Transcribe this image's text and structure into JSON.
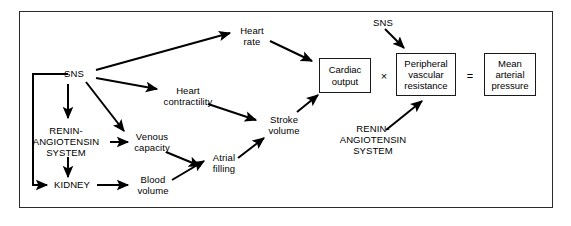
{
  "figure": {
    "frame": {
      "x": 19,
      "y": 11,
      "width": 534,
      "height": 197
    },
    "canvas": {
      "width": 571,
      "height": 226
    },
    "colors": {
      "background": "#ffffff",
      "stroke": "#000000",
      "frame_border": "#2b2b2b",
      "box_border": "#1a1a1a",
      "text": "#000000"
    }
  },
  "nodes": {
    "sns_left": {
      "label": "SNS",
      "cx": 74,
      "cy": 74
    },
    "renin_left": {
      "label": "RENIN-\nANGIOTENSIN\nSYSTEM",
      "cx": 66,
      "cy": 142
    },
    "kidney": {
      "label": "KIDNEY",
      "cx": 72,
      "cy": 185
    },
    "heart_rate": {
      "label": "Heart\nrate",
      "cx": 252,
      "cy": 36
    },
    "heart_contractility": {
      "label": "Heart\ncontractility",
      "cx": 188,
      "cy": 96
    },
    "venous_capacity": {
      "label": "Venous\ncapacity",
      "cx": 152,
      "cy": 142
    },
    "blood_volume": {
      "label": "Blood\nvolume",
      "cx": 153,
      "cy": 185
    },
    "atrial_filling": {
      "label": "Atrial\nfilling",
      "cx": 224,
      "cy": 163
    },
    "stroke_volume": {
      "label": "Stroke\nvolume",
      "cx": 284,
      "cy": 125
    },
    "sns_right": {
      "label": "SNS",
      "cx": 383,
      "cy": 23
    },
    "renin_right": {
      "label": "RENIN-\nANGIOTENSIN\nSYSTEM",
      "cx": 373,
      "cy": 140
    }
  },
  "boxes": {
    "cardiac_output": {
      "label": "Cardiac\noutput",
      "x": 319,
      "y": 58,
      "width": 52,
      "height": 35
    },
    "peripheral_vascular_resistance": {
      "label": "Peripheral\nvascular\nresistance",
      "x": 396,
      "y": 53,
      "width": 60,
      "height": 43
    },
    "mean_arterial_pressure": {
      "label": "Mean\narterial\npressure",
      "x": 484,
      "y": 53,
      "width": 52,
      "height": 43
    }
  },
  "operators": {
    "multiply": {
      "symbol": "×",
      "cx": 384,
      "cy": 76
    },
    "equals": {
      "symbol": "=",
      "cx": 470,
      "cy": 76
    }
  },
  "edges": [
    {
      "from": "sns_left",
      "to": "heart_rate",
      "type": "arrow"
    },
    {
      "from": "sns_left",
      "to": "heart_contractility",
      "type": "arrow"
    },
    {
      "from": "sns_left",
      "to": "venous_capacity",
      "type": "arrow"
    },
    {
      "from": "sns_left",
      "to": "renin_left",
      "type": "arrow"
    },
    {
      "from": "sns_left",
      "to": "kidney",
      "type": "elbow-arrow"
    },
    {
      "from": "renin_left",
      "to": "venous_capacity",
      "type": "arrow"
    },
    {
      "from": "renin_left",
      "to": "kidney",
      "type": "arrow"
    },
    {
      "from": "kidney",
      "to": "blood_volume",
      "type": "arrow"
    },
    {
      "from": "venous_capacity",
      "to": "atrial_filling",
      "type": "arrow"
    },
    {
      "from": "blood_volume",
      "to": "atrial_filling",
      "type": "arrow"
    },
    {
      "from": "atrial_filling",
      "to": "stroke_volume",
      "type": "arrow"
    },
    {
      "from": "heart_contractility",
      "to": "stroke_volume",
      "type": "arrow"
    },
    {
      "from": "heart_rate",
      "to": "cardiac_output",
      "type": "arrow"
    },
    {
      "from": "stroke_volume",
      "to": "cardiac_output",
      "type": "arrow"
    },
    {
      "from": "sns_right",
      "to": "peripheral_vascular_resistance",
      "type": "arrow"
    },
    {
      "from": "renin_right",
      "to": "peripheral_vascular_resistance",
      "type": "arrow"
    }
  ],
  "geometry": {
    "paths": [
      {
        "name": "sns-to-heart-rate",
        "d": "M 96 70 L 230 33",
        "arrow": true
      },
      {
        "name": "sns-to-heart-contractility",
        "d": "M 96 78 L 157 89",
        "arrow": true
      },
      {
        "name": "sns-to-venous-capacity",
        "d": "M 86 82 L 124 131",
        "arrow": true
      },
      {
        "name": "sns-to-renin",
        "d": "M 68 84 L 68 118",
        "arrow": true
      },
      {
        "name": "sns-elbow-to-kidney",
        "d": "M 68 74 L 33 74 L 33 185 L 47 185",
        "arrow": true
      },
      {
        "name": "renin-to-venous-capacity",
        "d": "M 110 142 L 128 142",
        "arrow": true
      },
      {
        "name": "renin-to-kidney",
        "d": "M 68 157 L 68 177",
        "arrow": true
      },
      {
        "name": "kidney-to-blood-volume",
        "d": "M 97 185 L 128 185",
        "arrow": true
      },
      {
        "name": "venous-capacity-to-atrial-filling",
        "d": "M 166 152 L 200 166",
        "arrow": true
      },
      {
        "name": "blood-volume-to-atrial-filling",
        "d": "M 172 180 L 204 161",
        "arrow": true
      },
      {
        "name": "atrial-filling-to-stroke-volume",
        "d": "M 238 158 L 264 138",
        "arrow": true
      },
      {
        "name": "heart-contractility-to-stroke-volume",
        "d": "M 208 104 L 256 120",
        "arrow": true
      },
      {
        "name": "heart-rate-to-cardiac-output",
        "d": "M 270 41 L 312 61",
        "arrow": true
      },
      {
        "name": "stroke-volume-to-cardiac-output",
        "d": "M 297 112 L 318 95",
        "arrow": true
      },
      {
        "name": "sns-right-to-pvr",
        "d": "M 385 29 L 404 48",
        "arrow": true
      },
      {
        "name": "renin-right-to-pvr",
        "d": "M 386 130 L 422 101",
        "arrow": true
      }
    ]
  }
}
